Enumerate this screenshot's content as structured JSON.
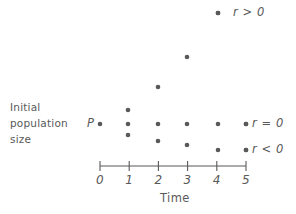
{
  "figure": {
    "kind": "scatter",
    "background_color": "#ffffff",
    "ink_color": "#595959",
    "dot_color": "#595959",
    "dot_radius_px": 2.3
  },
  "axis": {
    "x_label": "Time",
    "tick_labels": [
      "0",
      "1",
      "2",
      "3",
      "4",
      "5"
    ],
    "tick_values": [
      0,
      1,
      2,
      3,
      4,
      5
    ],
    "line_y_px": 166,
    "x_start_px": 100,
    "x_end_px": 246,
    "px_per_unit": 29.2,
    "tick_half_height_px": 5
  },
  "side_label": {
    "lines": [
      "Initial",
      "population",
      "size"
    ]
  },
  "point_labels": {
    "initial_population": "P"
  },
  "curve_labels": [
    {
      "id": "r-greater-than-zero",
      "text": "r > 0",
      "dot_x_px": 218,
      "dot_y_px": 13,
      "text_x_px": 233,
      "text_y_px": 13
    },
    {
      "id": "r-equals-zero",
      "text": "r = 0",
      "dot_x_px": 246,
      "dot_y_px": 124,
      "text_x_px": 252,
      "text_y_px": 124
    },
    {
      "id": "r-less-than-zero",
      "text": "r < 0",
      "dot_x_px": 246,
      "dot_y_px": 150,
      "text_x_px": 252,
      "text_y_px": 150
    }
  ],
  "chart_data": {
    "type": "scatter",
    "title": "",
    "xlabel": "Time",
    "ylabel": "Initial population size",
    "xlim": [
      0,
      5
    ],
    "ylim": [
      0,
      10
    ],
    "grid": false,
    "legend_position": "right",
    "x_tick_labels": [
      "0",
      "1",
      "2",
      "3",
      "4",
      "5"
    ],
    "annotations": [
      {
        "text": "P",
        "x": 0,
        "y": 3,
        "note": "initial population size marker"
      },
      {
        "text": "Initial population size",
        "x": -1.2,
        "y": 3,
        "note": "y-axis description at left"
      },
      {
        "text": "r > 0",
        "x": 5.2,
        "y": 9.6,
        "note": "growing population curve label"
      },
      {
        "text": "r = 0",
        "x": 5.2,
        "y": 3,
        "note": "constant population curve label"
      },
      {
        "text": "r < 0",
        "x": 5.2,
        "y": 1.1,
        "note": "declining population curve label"
      }
    ],
    "series": [
      {
        "name": "r > 0",
        "color": "#595959",
        "x": [
          0,
          1,
          2,
          3,
          4
        ],
        "y": [
          3,
          3.6,
          5.1,
          7.3,
          9.6
        ],
        "px": [
          {
            "x": 100,
            "y": 124
          },
          {
            "x": 128,
            "y": 110
          },
          {
            "x": 158,
            "y": 87
          },
          {
            "x": 187,
            "y": 57
          },
          {
            "x": 218,
            "y": 13
          }
        ]
      },
      {
        "name": "r = 0",
        "color": "#595959",
        "x": [
          0,
          1,
          2,
          3,
          4,
          5
        ],
        "y": [
          3,
          3,
          3,
          3,
          3,
          3
        ],
        "px": [
          {
            "x": 100,
            "y": 124
          },
          {
            "x": 128,
            "y": 124
          },
          {
            "x": 158,
            "y": 124
          },
          {
            "x": 187,
            "y": 124
          },
          {
            "x": 218,
            "y": 124
          },
          {
            "x": 246,
            "y": 124
          }
        ]
      },
      {
        "name": "r < 0",
        "color": "#595959",
        "x": [
          0,
          1,
          2,
          3,
          4,
          5
        ],
        "y": [
          3,
          2.4,
          1.9,
          1.55,
          1.1,
          1.1
        ],
        "px": [
          {
            "x": 100,
            "y": 124
          },
          {
            "x": 128,
            "y": 135
          },
          {
            "x": 158,
            "y": 141
          },
          {
            "x": 187,
            "y": 145
          },
          {
            "x": 218,
            "y": 150
          },
          {
            "x": 246,
            "y": 150
          }
        ]
      }
    ]
  }
}
